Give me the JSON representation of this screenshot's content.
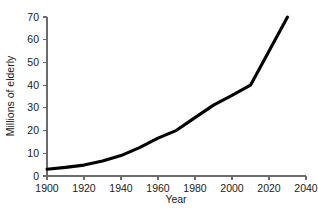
{
  "chart_data": {
    "type": "line",
    "title": "",
    "xlabel": "Year",
    "ylabel": "Millions of elderly",
    "xlim": [
      1900,
      2040
    ],
    "ylim": [
      0,
      70
    ],
    "xticks": [
      1900,
      1920,
      1940,
      1960,
      1980,
      2000,
      2020,
      2040
    ],
    "yticks": [
      0,
      10,
      20,
      30,
      40,
      50,
      60,
      70
    ],
    "xtick_labels": [
      "1900",
      "1920",
      "1940",
      "1960",
      "1980",
      "2000",
      "2020",
      "2040"
    ],
    "ytick_labels": [
      "0",
      "10",
      "20",
      "30",
      "40",
      "50",
      "60",
      "70"
    ],
    "grid": false,
    "legend": "none",
    "series": [
      {
        "name": "Millions of elderly",
        "color": "#000000",
        "x": [
          1900,
          1910,
          1920,
          1930,
          1940,
          1950,
          1960,
          1970,
          1980,
          1990,
          2000,
          2010,
          2030
        ],
        "values": [
          3,
          3.8,
          4.8,
          6.6,
          9,
          12.5,
          16.7,
          20.1,
          25.7,
          31.2,
          35.5,
          40,
          70
        ]
      }
    ]
  },
  "axes": {
    "y_label": "Millions of elderly",
    "x_label": "Year"
  },
  "colors": {
    "background": "#ffffff",
    "line": "#000000",
    "axis": "#6b6b6b",
    "text": "#1a1a1a"
  }
}
